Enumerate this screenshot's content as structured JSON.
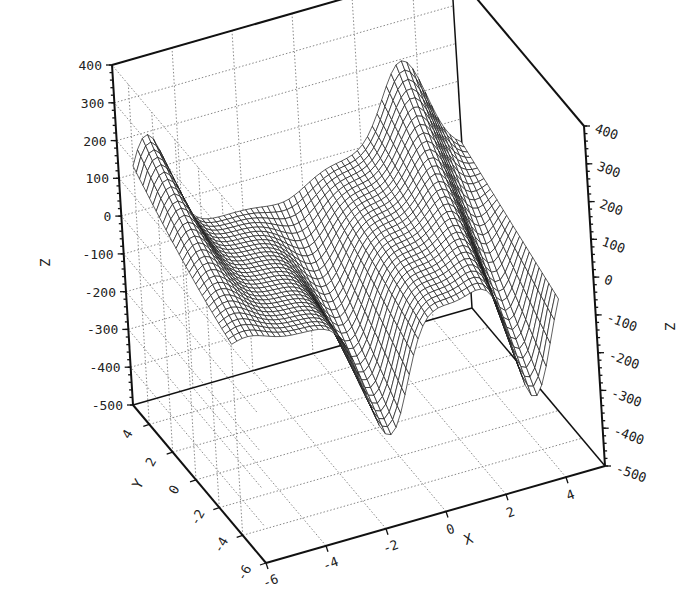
{
  "chart_data": {
    "type": "surface3d",
    "title": "",
    "xlabel": "X",
    "ylabel": "Y",
    "zlabel": "Z",
    "xlim": [
      -6,
      5.3
    ],
    "ylim": [
      -6,
      5.4
    ],
    "zlim": [
      -500,
      400
    ],
    "x_ticks": [
      -6,
      -4,
      -2,
      0,
      2,
      4
    ],
    "y_ticks": [
      -6,
      -4,
      -2,
      0,
      2,
      4
    ],
    "z_ticks": [
      -500,
      -400,
      -300,
      -200,
      -100,
      0,
      100,
      200,
      300,
      400
    ],
    "x_tick_labels": [
      "-6",
      "-4",
      "-2",
      "0",
      "2",
      "4"
    ],
    "y_tick_labels": [
      "-6",
      "-4",
      "-2",
      "0",
      "2",
      "4"
    ],
    "z_tick_labels_left": [
      "-500",
      "-400",
      "-300",
      "-200",
      "-100",
      "0",
      "100",
      "200",
      "300",
      "400"
    ],
    "z_tick_labels_right": [
      "-500",
      "-400",
      "-300",
      "-200",
      "-100",
      "0",
      "100",
      "200",
      "300",
      "400"
    ],
    "grid": true,
    "grid_style": "dotted",
    "surface_style": "wireframe mesh, black lines on white",
    "mesh_resolution": {
      "x": 60,
      "y": 30
    },
    "surface_description": "Saddle-like double-well surface: high ridges (~250-300) at back-left corner and back-right corner, deep troughs (~-450 to -500) at front edge near x=-1 and x=4, central hump (~-250) around x=1.5, front edge.",
    "legend": null
  }
}
